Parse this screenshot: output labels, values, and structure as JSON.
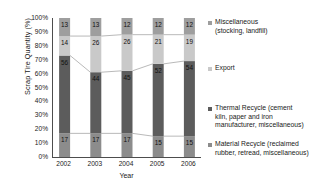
{
  "chart_data": {
    "type": "bar",
    "stacked": true,
    "normalized_percent": true,
    "title": "",
    "xlabel": "Year",
    "ylabel": "Scrap Tire Quantity (%)",
    "categories": [
      "2002",
      "2003",
      "2004",
      "2005",
      "2006"
    ],
    "ylim": [
      0,
      100
    ],
    "ytick_labels": [
      "0%",
      "10%",
      "20%",
      "30%",
      "40%",
      "50%",
      "60%",
      "70%",
      "80%",
      "90%",
      "100%"
    ],
    "ytick_values": [
      0,
      10,
      20,
      30,
      40,
      50,
      60,
      70,
      80,
      90,
      100
    ],
    "grid": false,
    "legend_position": "right",
    "connector_lines": true,
    "series": [
      {
        "name": "Material Recycle (reclaimed rubber, retread, miscellaneous)",
        "short_name": "Material Recycle",
        "color": "#8c8c8c",
        "stack_order": 0,
        "values": [
          17,
          17,
          17,
          15,
          15
        ]
      },
      {
        "name": "Thermal Recycle (cement kiln, paper and iron manufacturer, miscellaneous)",
        "short_name": "Thermal Recycle",
        "color": "#5c5c5c",
        "stack_order": 1,
        "values": [
          56,
          44,
          45,
          52,
          54
        ]
      },
      {
        "name": "Export",
        "short_name": "Export",
        "color": "#c9c9c9",
        "stack_order": 2,
        "values": [
          14,
          26,
          26,
          21,
          19
        ]
      },
      {
        "name": "Miscellaneous (stocking, landfill)",
        "short_name": "Miscellaneous",
        "color": "#9e9e9e",
        "stack_order": 3,
        "values": [
          13,
          13,
          12,
          12,
          12
        ]
      }
    ]
  },
  "legend": {
    "entries": [
      {
        "label": "Miscellaneous\n(stocking, landfill)",
        "color": "#9e9e9e"
      },
      {
        "label": "Export",
        "color": "#c9c9c9"
      },
      {
        "label": "Thermal Recycle (cement\nkiln, paper and iron\nmanufacturer, miscellaneous)",
        "color": "#5c5c5c"
      },
      {
        "label": "Material Recycle (reclaimed\nrubber, retread, miscellaneous)",
        "color": "#8c8c8c"
      }
    ]
  },
  "axes": {
    "y_title": "Scrap Tire Quantity (%)",
    "x_title": "Year"
  }
}
